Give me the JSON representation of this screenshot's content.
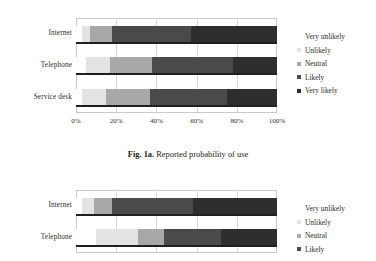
{
  "figures": [
    {
      "id": "fig-1a",
      "caption_bold": "Fig. 1a.",
      "caption_text": " Reported probability of use",
      "legend_title": "",
      "legend": [
        {
          "label": "Very unlikely",
          "color": "#ffffff"
        },
        {
          "label": "Unlikely",
          "color": "#e3e3e3"
        },
        {
          "label": "Neutral",
          "color": "#a8a8a8"
        },
        {
          "label": "Likely",
          "color": "#4a4a4a"
        },
        {
          "label": "Very likely",
          "color": "#2e2e2e"
        }
      ],
      "chart_data": {
        "type": "bar",
        "orientation": "horizontal",
        "stacked": true,
        "normalized": true,
        "title": "Fig. 1a. Reported probability of use",
        "xlabel": "",
        "ylabel": "",
        "xlim": [
          0,
          100
        ],
        "xticks": [
          0,
          20,
          40,
          60,
          80,
          100
        ],
        "xticklabels": [
          "0%",
          "20%",
          "40%",
          "60%",
          "80%",
          "100%"
        ],
        "grid": true,
        "legend_position": "right",
        "categories": [
          "Internet",
          "Telephone",
          "Service desk"
        ],
        "series": [
          {
            "name": "Very unlikely",
            "color": "#ffffff",
            "values": [
              3,
              5,
              3
            ]
          },
          {
            "name": "Unlikely",
            "color": "#e3e3e3",
            "values": [
              4,
              12,
              12
            ]
          },
          {
            "name": "Neutral",
            "color": "#a8a8a8",
            "values": [
              11,
              21,
              22
            ]
          },
          {
            "name": "Likely",
            "color": "#4a4a4a",
            "values": [
              39,
              40,
              38
            ]
          },
          {
            "name": "Very likely",
            "color": "#2e2e2e",
            "values": [
              43,
              22,
              25
            ]
          }
        ]
      }
    },
    {
      "id": "fig-1b",
      "caption_bold": "",
      "caption_text": "",
      "legend": [
        {
          "label": "Very unlikely",
          "color": "#ffffff"
        },
        {
          "label": "Unlikely",
          "color": "#e3e3e3"
        },
        {
          "label": "Neutral",
          "color": "#a8a8a8"
        },
        {
          "label": "Likely",
          "color": "#4a4a4a"
        }
      ],
      "chart_data": {
        "type": "bar",
        "orientation": "horizontal",
        "stacked": true,
        "normalized": true,
        "title": "",
        "xlabel": "",
        "ylabel": "",
        "xlim": [
          0,
          100
        ],
        "xticks": [
          0,
          20,
          40,
          60,
          80,
          100
        ],
        "xticklabels": [
          "0%",
          "20%",
          "40%",
          "60%",
          "80%",
          "100%"
        ],
        "grid": true,
        "legend_position": "right",
        "categories": [
          "Internet",
          "Telephone"
        ],
        "series": [
          {
            "name": "Very unlikely",
            "color": "#ffffff",
            "values": [
              3,
              10
            ]
          },
          {
            "name": "Unlikely",
            "color": "#e3e3e3",
            "values": [
              6,
              21
            ]
          },
          {
            "name": "Neutral",
            "color": "#a8a8a8",
            "values": [
              9,
              13
            ]
          },
          {
            "name": "Likely",
            "color": "#4a4a4a",
            "values": [
              40,
              28
            ]
          },
          {
            "name": "Very likely",
            "color": "#2e2e2e",
            "values": [
              42,
              28
            ]
          }
        ]
      }
    }
  ]
}
